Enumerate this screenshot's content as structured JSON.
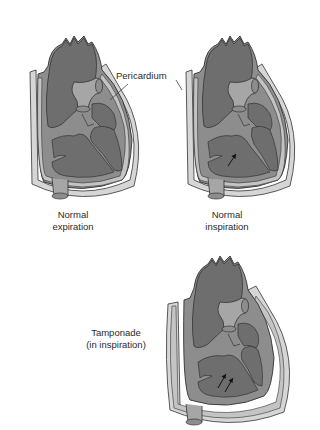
{
  "diagram": {
    "callout": {
      "text": "Pericardium",
      "points_to": [
        "heart-normal-expiration",
        "heart-normal-inspiration"
      ]
    },
    "panels": [
      {
        "id": "normal-expiration",
        "label_line1": "Normal",
        "label_line2": "expiration",
        "arrows": 0
      },
      {
        "id": "normal-inspiration",
        "label_line1": "Normal",
        "label_line2": "inspiration",
        "arrows": 1
      },
      {
        "id": "tamponade",
        "label_line1": "Tamponade",
        "label_line2": "(in inspiration)",
        "arrows": 2
      }
    ],
    "colors": {
      "chamber_dark": "#6e6e6e",
      "myocardium": "#8d8d8d",
      "pericardial_space": "#c4c4c4",
      "outline": "#333333",
      "vessel_light": "#a6a6a6",
      "background": "#ffffff"
    }
  }
}
